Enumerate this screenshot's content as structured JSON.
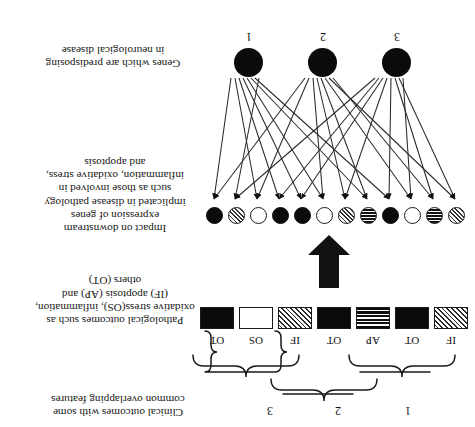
{
  "figure": {
    "orientation_degrees": 180,
    "background_color": "#ffffff",
    "ink_color": "#111111"
  },
  "sections": {
    "genes": {
      "caption": "Genes which are predisposing in neurological disease",
      "labels": [
        "1",
        "2",
        "3"
      ],
      "nodes": [
        {
          "id": "g1",
          "label": "1",
          "fill": "solid"
        },
        {
          "id": "g2",
          "label": "2",
          "fill": "solid"
        },
        {
          "id": "g3",
          "label": "3",
          "fill": "solid"
        }
      ]
    },
    "downstream": {
      "caption": "Impact on downstream expression of genes implicated in disease pathology such as those involved in inflammation, oxidative stress, and apoptosis",
      "caption_lines": [
        "Impact on downstream",
        "expression of genes",
        "implicated in disease pathology",
        "such as those involved in",
        "inflammation, oxidative stress,",
        "and apoptosis"
      ],
      "circles": [
        {
          "index": 1,
          "fill": "solid"
        },
        {
          "index": 2,
          "fill": "hatch"
        },
        {
          "index": 3,
          "fill": "white"
        },
        {
          "index": 4,
          "fill": "solid"
        },
        {
          "index": 5,
          "fill": "solid"
        },
        {
          "index": 6,
          "fill": "white"
        },
        {
          "index": 7,
          "fill": "hatch"
        },
        {
          "index": 8,
          "fill": "stripe"
        },
        {
          "index": 9,
          "fill": "solid"
        },
        {
          "index": 10,
          "fill": "white"
        },
        {
          "index": 11,
          "fill": "stripe"
        },
        {
          "index": 12,
          "fill": "hatch"
        }
      ]
    },
    "pathological": {
      "caption": "Pathological outcomes such as oxidative stress(OS), inflammation, (IF) apoptosis (AP) and others (OT)",
      "caption_lines": [
        "Pathological outcomes such as",
        "oxidative stress(OS), inflammation,",
        "(IF) apoptosis (AP) and",
        "others (OT)"
      ],
      "legend": {
        "OS": "oxidative stress",
        "IF": "inflammation",
        "AP": "apoptosis",
        "OT": "others"
      },
      "boxes": [
        {
          "index": 1,
          "label": "OT",
          "fill": "solid"
        },
        {
          "index": 2,
          "label": "OS",
          "fill": "white"
        },
        {
          "index": 3,
          "label": "IF",
          "fill": "hatch"
        },
        {
          "index": 4,
          "label": "OT",
          "fill": "solid"
        },
        {
          "index": 5,
          "label": "AP",
          "fill": "stripe"
        },
        {
          "index": 6,
          "label": "OT",
          "fill": "solid"
        },
        {
          "index": 7,
          "label": "IF",
          "fill": "hatch"
        }
      ]
    },
    "clinical": {
      "caption": "Clinical outcomes with some common overlapping features",
      "caption_lines": [
        "Clinical outcomes with some",
        "common overlapping features"
      ],
      "groups": [
        {
          "label": "1",
          "spans_boxes": [
            1,
            3
          ]
        },
        {
          "label": "2",
          "spans_boxes": [
            3,
            5
          ]
        },
        {
          "label": "3",
          "spans_boxes": [
            5,
            7
          ]
        }
      ]
    }
  },
  "connectors": {
    "big_arrow": {
      "name": "down-arrow",
      "direction": "down",
      "color": "#111111"
    },
    "fan_arrows_count": 24
  }
}
